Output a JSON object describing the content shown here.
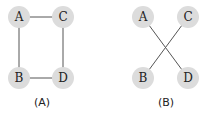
{
  "panels": [
    {
      "caption": "(A)",
      "nodes": [
        {
          "label": "A",
          "x": 19,
          "y": 17
        },
        {
          "label": "C",
          "x": 63,
          "y": 17
        },
        {
          "label": "B",
          "x": 19,
          "y": 78
        },
        {
          "label": "D",
          "x": 63,
          "y": 78
        }
      ],
      "edges": [
        [
          "A",
          "C"
        ],
        [
          "A",
          "B"
        ],
        [
          "C",
          "D"
        ],
        [
          "B",
          "D"
        ]
      ],
      "caption_pos": {
        "x": 42,
        "y": 102
      }
    },
    {
      "caption": "(B)",
      "nodes": [
        {
          "label": "A",
          "x": 143,
          "y": 17
        },
        {
          "label": "C",
          "x": 188,
          "y": 17
        },
        {
          "label": "B",
          "x": 143,
          "y": 78
        },
        {
          "label": "D",
          "x": 188,
          "y": 78
        }
      ],
      "edges": [
        [
          "A",
          "D"
        ],
        [
          "C",
          "B"
        ]
      ],
      "caption_pos": {
        "x": 166,
        "y": 102
      }
    }
  ],
  "style": {
    "node_fill": "#dcdcdc",
    "edge_color": "#555555",
    "node_radius": 11
  }
}
